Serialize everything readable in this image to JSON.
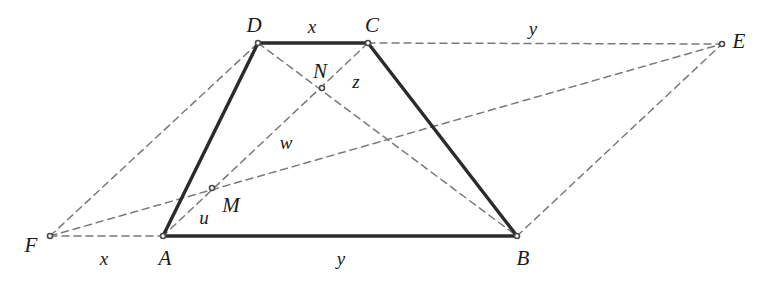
{
  "figure": {
    "kind": "geometry-diagram",
    "width": 764,
    "height": 291,
    "background_color": "#ffffff",
    "solid_stroke_color": "#2b2b2b",
    "dashed_stroke_color": "#7a7a7a",
    "point_marker_color": "#4a4a4a"
  },
  "points": [
    {
      "id": "A",
      "label": "A",
      "x": 163,
      "y": 236,
      "label_x": 165,
      "label_y": 258,
      "marker": true
    },
    {
      "id": "B",
      "label": "B",
      "x": 517,
      "y": 236,
      "label_x": 523,
      "label_y": 258,
      "marker": true
    },
    {
      "id": "C",
      "label": "C",
      "x": 368,
      "y": 43,
      "label_x": 372,
      "label_y": 25,
      "marker": true
    },
    {
      "id": "D",
      "label": "D",
      "x": 258,
      "y": 43,
      "label_x": 254,
      "label_y": 25,
      "marker": true
    },
    {
      "id": "E",
      "label": "E",
      "x": 722,
      "y": 44,
      "label_x": 739,
      "label_y": 41,
      "marker": true
    },
    {
      "id": "F",
      "label": "F",
      "x": 50,
      "y": 236,
      "label_x": 31,
      "label_y": 245,
      "marker": true
    },
    {
      "id": "M",
      "label": "M",
      "x": 212,
      "y": 188,
      "label_x": 231,
      "label_y": 205,
      "marker": true
    },
    {
      "id": "N",
      "label": "N",
      "x": 322,
      "y": 88,
      "label_x": 320,
      "label_y": 71,
      "marker": true
    }
  ],
  "solid_segments": [
    {
      "id": "AB",
      "name": "base-ab",
      "from": "A",
      "to": "B"
    },
    {
      "id": "DC",
      "name": "top-dc",
      "from": "D",
      "to": "C"
    },
    {
      "id": "AD",
      "name": "leg-ad",
      "from": "A",
      "to": "D"
    },
    {
      "id": "CB",
      "name": "leg-cb",
      "from": "C",
      "to": "B"
    }
  ],
  "dashed_segments": [
    {
      "id": "CE",
      "name": "extension-ce",
      "from": "C",
      "to": "E"
    },
    {
      "id": "DB",
      "name": "diagonal-db",
      "from": "D",
      "to": "B"
    },
    {
      "id": "CA",
      "name": "diagonal-ca",
      "from": "C",
      "to": "A"
    },
    {
      "id": "FA",
      "name": "extension-fa",
      "from": "F",
      "to": "A"
    },
    {
      "id": "FD",
      "name": "line-fd",
      "from": "F",
      "to": "D"
    },
    {
      "id": "FE",
      "name": "line-f-m-e",
      "from": "F",
      "to": "E"
    },
    {
      "id": "BE",
      "name": "line-be",
      "from": "B",
      "to": "E"
    }
  ],
  "segment_labels": [
    {
      "id": "x-top",
      "text": "x",
      "x": 312,
      "y": 26,
      "for": "DC"
    },
    {
      "id": "y-top",
      "text": "y",
      "x": 533,
      "y": 28,
      "for": "CE"
    },
    {
      "id": "x-bottom",
      "text": "x",
      "x": 104,
      "y": 258,
      "for": "FA"
    },
    {
      "id": "y-bottom",
      "text": "y",
      "x": 341,
      "y": 258,
      "for": "AB"
    },
    {
      "id": "z",
      "text": "z",
      "x": 356,
      "y": 81,
      "for": "NC"
    },
    {
      "id": "w",
      "text": "w",
      "x": 286,
      "y": 142,
      "for": "NA"
    },
    {
      "id": "u",
      "text": "u",
      "x": 204,
      "y": 217,
      "for": "AM"
    }
  ]
}
